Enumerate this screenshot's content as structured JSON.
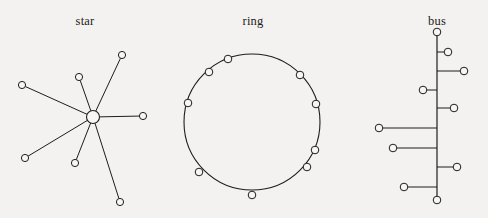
{
  "page": {
    "background_color": "#f4f2f0",
    "ink_color": "#1d1d1d",
    "node_fill": "#f7f6f4",
    "width": 488,
    "height": 218
  },
  "figures": [
    {
      "id": "star",
      "caption": "star",
      "caption_x": 85,
      "caption_y": 14,
      "type": "star-topology",
      "hub": {
        "x": 93,
        "y": 117,
        "r": 6.5
      },
      "leaves": [
        {
          "x": 22,
          "y": 85,
          "r": 3.6
        },
        {
          "x": 79,
          "y": 77,
          "r": 3.6
        },
        {
          "x": 122,
          "y": 55,
          "r": 3.6
        },
        {
          "x": 143,
          "y": 116,
          "r": 3.6
        },
        {
          "x": 120,
          "y": 202,
          "r": 3.6
        },
        {
          "x": 75,
          "y": 163,
          "r": 3.6
        },
        {
          "x": 25,
          "y": 158,
          "r": 3.6
        }
      ]
    },
    {
      "id": "ring",
      "caption": "ring",
      "caption_x": 253,
      "caption_y": 14,
      "type": "ring-topology",
      "circle": {
        "cx": 252,
        "cy": 122,
        "r": 68
      },
      "nodes": [
        {
          "x": 228,
          "y": 59,
          "r": 3.8
        },
        {
          "x": 209,
          "y": 72,
          "r": 3.8
        },
        {
          "x": 188,
          "y": 103,
          "r": 3.8
        },
        {
          "x": 199,
          "y": 172,
          "r": 3.8
        },
        {
          "x": 252,
          "y": 195,
          "r": 3.8
        },
        {
          "x": 307,
          "y": 167,
          "r": 3.8
        },
        {
          "x": 315,
          "y": 150,
          "r": 3.8
        },
        {
          "x": 316,
          "y": 104,
          "r": 3.8
        },
        {
          "x": 300,
          "y": 75,
          "r": 3.8
        }
      ]
    },
    {
      "id": "bus",
      "caption": "bus",
      "caption_x": 437,
      "caption_y": 14,
      "type": "bus-topology",
      "spine": {
        "x": 437,
        "y1": 32,
        "y2": 200
      },
      "terminals": [
        {
          "x": 437,
          "y": 32,
          "r": 3.8
        },
        {
          "x": 437,
          "y": 200,
          "r": 3.8
        }
      ],
      "stubs": [
        {
          "y": 52,
          "x": 448,
          "side": "right",
          "r": 3.8
        },
        {
          "y": 71,
          "x": 464,
          "side": "right",
          "r": 3.8
        },
        {
          "y": 90,
          "x": 423,
          "side": "left",
          "r": 3.8
        },
        {
          "y": 108,
          "x": 454,
          "side": "right",
          "r": 3.8
        },
        {
          "y": 128,
          "x": 379,
          "side": "left",
          "r": 3.8
        },
        {
          "y": 148,
          "x": 393,
          "side": "left",
          "r": 3.8
        },
        {
          "y": 167,
          "x": 457,
          "side": "right",
          "r": 3.8
        },
        {
          "y": 187,
          "x": 404,
          "side": "left",
          "r": 3.8
        }
      ]
    }
  ]
}
